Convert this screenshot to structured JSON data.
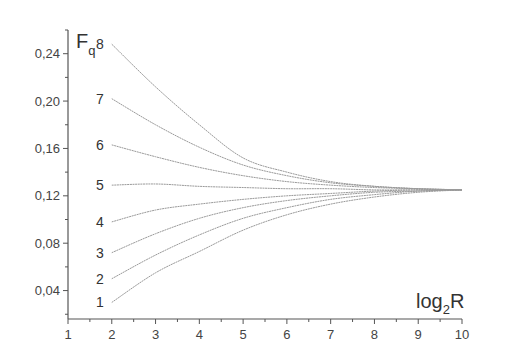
{
  "chart_data": {
    "type": "line",
    "title": "",
    "xlabel": "log2R",
    "xlabel_main": "log",
    "xlabel_sub": "2",
    "xlabel_tail": "R",
    "ylabel": "Fq",
    "ylabel_main": "F",
    "ylabel_sub": "q",
    "xlim": [
      1,
      10
    ],
    "ylim": [
      0.016,
      0.26
    ],
    "x_ticks": [
      1,
      2,
      3,
      4,
      5,
      6,
      7,
      8,
      9,
      10
    ],
    "x_tick_labels": [
      "1",
      "2",
      "3",
      "4",
      "5",
      "6",
      "7",
      "8",
      "9",
      "10"
    ],
    "y_ticks": [
      0.04,
      0.08,
      0.12,
      0.16,
      0.2,
      0.24
    ],
    "y_tick_labels": [
      "0,04",
      "0,08",
      "0,12",
      "0,16",
      "0,20",
      "0,24"
    ],
    "grid": false,
    "legend": "inline curve labels at x=2",
    "x": [
      2,
      3,
      4,
      5,
      6,
      7,
      8,
      9,
      10
    ],
    "series": [
      {
        "name": "1",
        "values": [
          0.03,
          0.055,
          0.073,
          0.091,
          0.104,
          0.113,
          0.119,
          0.123,
          0.125
        ]
      },
      {
        "name": "2",
        "values": [
          0.05,
          0.07,
          0.087,
          0.101,
          0.11,
          0.117,
          0.121,
          0.124,
          0.125
        ]
      },
      {
        "name": "3",
        "values": [
          0.072,
          0.088,
          0.101,
          0.11,
          0.116,
          0.12,
          0.123,
          0.124,
          0.125
        ]
      },
      {
        "name": "4",
        "values": [
          0.098,
          0.108,
          0.113,
          0.117,
          0.12,
          0.122,
          0.124,
          0.125,
          0.125
        ]
      },
      {
        "name": "5",
        "values": [
          0.129,
          0.13,
          0.128,
          0.127,
          0.126,
          0.126,
          0.125,
          0.125,
          0.125
        ]
      },
      {
        "name": "6",
        "values": [
          0.163,
          0.153,
          0.144,
          0.137,
          0.132,
          0.129,
          0.127,
          0.126,
          0.125
        ]
      },
      {
        "name": "7",
        "values": [
          0.202,
          0.18,
          0.161,
          0.146,
          0.137,
          0.131,
          0.128,
          0.126,
          0.125
        ]
      },
      {
        "name": "8",
        "values": [
          0.248,
          0.212,
          0.18,
          0.152,
          0.14,
          0.132,
          0.128,
          0.126,
          0.125
        ]
      }
    ]
  },
  "colors": {
    "axis": "#555555",
    "curve": "#9a9a9a",
    "text": "#333333"
  }
}
